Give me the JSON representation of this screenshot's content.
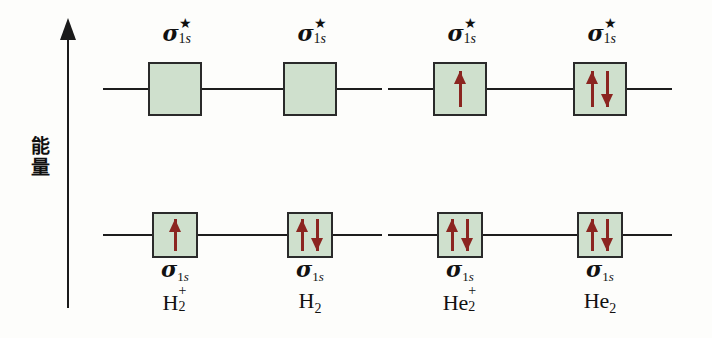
{
  "figure": {
    "type": "molecular-orbital-energy-diagram",
    "background_color": "#fdfdfb",
    "box_fill_color": "#cfe0cd",
    "box_border_color": "#2a2a2a",
    "arrow_color": "#8b2520",
    "line_color": "#1d1d1d"
  },
  "axis": {
    "name": "energy-axis",
    "label_chars": [
      "能",
      "量"
    ],
    "label_text": "能量",
    "direction": "up",
    "arrowhead": "up-triangle"
  },
  "labels": {
    "sigma": "σ",
    "star": "★",
    "subscript_1s": "1s",
    "antibonding_label": "σ*1s",
    "bonding_label": "σ1s"
  },
  "columns": [
    {
      "id": "h2-plus",
      "molecule_base": "H",
      "molecule_sub": "2",
      "molecule_sup": "+",
      "molecule_text": "H2+",
      "antibonding": {
        "label": "σ*1s",
        "electrons": []
      },
      "bonding": {
        "label": "σ1s",
        "electrons": [
          "up"
        ]
      },
      "electron_count": 1,
      "bond_order": 0.5
    },
    {
      "id": "h2",
      "molecule_base": "H",
      "molecule_sub": "2",
      "molecule_sup": "",
      "molecule_text": "H2",
      "antibonding": {
        "label": "σ*1s",
        "electrons": []
      },
      "bonding": {
        "label": "σ1s",
        "electrons": [
          "up",
          "down"
        ]
      },
      "electron_count": 2,
      "bond_order": 1
    },
    {
      "id": "he2-plus",
      "molecule_base": "He",
      "molecule_sub": "2",
      "molecule_sup": "+",
      "molecule_text": "He2+",
      "antibonding": {
        "label": "σ*1s",
        "electrons": [
          "up"
        ]
      },
      "bonding": {
        "label": "σ1s",
        "electrons": [
          "up",
          "down"
        ]
      },
      "electron_count": 3,
      "bond_order": 0.5
    },
    {
      "id": "he2",
      "molecule_base": "He",
      "molecule_sub": "2",
      "molecule_sup": "",
      "molecule_text": "He2",
      "antibonding": {
        "label": "σ*1s",
        "electrons": [
          "up",
          "down"
        ]
      },
      "bonding": {
        "label": "σ1s",
        "electrons": [
          "up",
          "down"
        ]
      },
      "electron_count": 4,
      "bond_order": 0
    }
  ]
}
